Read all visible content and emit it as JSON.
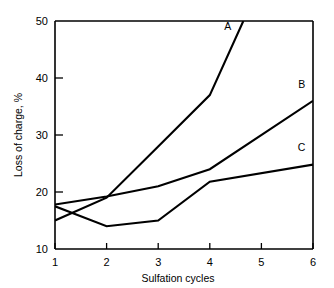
{
  "chart_data": {
    "type": "line",
    "title": "",
    "xlabel": "Sulfation cycles",
    "ylabel": "Loss of charge, %",
    "xlim": [
      1,
      6
    ],
    "ylim": [
      10,
      50
    ],
    "xticks": [
      1,
      2,
      3,
      4,
      5,
      6
    ],
    "yticks": [
      10,
      20,
      30,
      40,
      50
    ],
    "xtick_labels": [
      "1",
      "2",
      "3",
      "4",
      "5",
      "6"
    ],
    "ytick_labels": [
      "10",
      "20",
      "30",
      "40",
      "50"
    ],
    "grid": false,
    "legend": "inline-end-labels",
    "frame_color": "#000000",
    "line_color": "#000000",
    "background": "#ffffff",
    "series": [
      {
        "name": "A",
        "label": "A",
        "x": [
          1,
          2,
          3,
          4,
          4.65
        ],
        "values": [
          15.0,
          19.0,
          28.0,
          37.0,
          50.0
        ],
        "clipped_at_top": true,
        "label_position": {
          "x": 4.35,
          "y": 48.5
        }
      },
      {
        "name": "B",
        "label": "B",
        "x": [
          1,
          2,
          3,
          4,
          6
        ],
        "values": [
          17.8,
          19.2,
          21.0,
          24.0,
          36.0
        ],
        "clipped_at_top": false,
        "label_position": {
          "x": 5.78,
          "y": 38.3
        }
      },
      {
        "name": "C",
        "label": "C",
        "x": [
          1,
          2,
          3,
          4,
          6
        ],
        "values": [
          17.5,
          14.0,
          15.0,
          21.8,
          24.8
        ],
        "clipped_at_top": false,
        "label_position": {
          "x": 5.78,
          "y": 27.2
        }
      }
    ]
  },
  "axes": {
    "x_title": "Sulfation cycles",
    "y_title": "Loss of charge, %"
  }
}
